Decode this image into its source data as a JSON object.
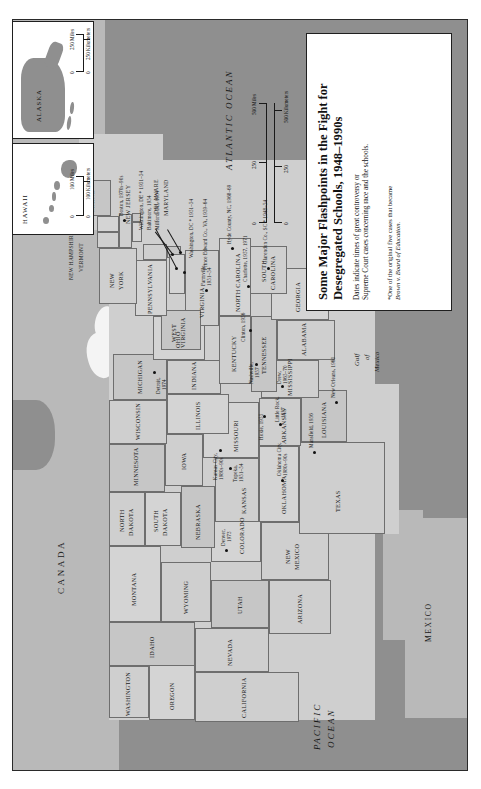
{
  "document": {
    "kind": "historical-thematic-map",
    "orientation": "landscape-printed-sideways"
  },
  "title_card": {
    "title_line_1": "Some Major Flashpoints in the Fight for",
    "title_line_2": "Desegregated Schools, 1948–1990s",
    "subtitle_line_1": "Dates indicate times of great controversy or",
    "subtitle_line_2": "Supreme Court cases concerning race and the schools.",
    "footnote_line_1": "*One of the original five cases that became",
    "footnote_line_2": "Brown v. Board of Education."
  },
  "main_scale": {
    "miles_label": "500 Miles",
    "miles_ticks": [
      "0",
      "250",
      "500"
    ],
    "km_label": "500 Kilometers",
    "km_ticks": [
      "0",
      "250",
      "500"
    ]
  },
  "oceans": {
    "atlantic": "ATLANTIC OCEAN",
    "pacific_line_1": "PACIFIC",
    "pacific_line_2": "OCEAN",
    "gulf_line_1": "Gulf",
    "gulf_line_2": "of",
    "gulf_line_3": "Mexico"
  },
  "countries": {
    "canada": "CANADA",
    "mexico": "MEXICO"
  },
  "states": [
    {
      "name": "WASHINGTON"
    },
    {
      "name": "OREGON"
    },
    {
      "name": "IDAHO"
    },
    {
      "name": "MONTANA"
    },
    {
      "name": "WYOMING"
    },
    {
      "name": "NEVADA"
    },
    {
      "name": "UTAH"
    },
    {
      "name": "CALIFORNIA"
    },
    {
      "name": "ARIZONA"
    },
    {
      "name": "NEW\nMEXICO"
    },
    {
      "name": "COLORADO"
    },
    {
      "name": "NORTH\nDAKOTA"
    },
    {
      "name": "SOUTH\nDAKOTA"
    },
    {
      "name": "NEBRASKA"
    },
    {
      "name": "KANSAS"
    },
    {
      "name": "OKLAHOMA"
    },
    {
      "name": "TEXAS"
    },
    {
      "name": "MINNESOTA"
    },
    {
      "name": "IOWA"
    },
    {
      "name": "MISSOURI"
    },
    {
      "name": "ARKANSAS"
    },
    {
      "name": "LOUISIANA"
    },
    {
      "name": "WISCONSIN"
    },
    {
      "name": "ILLINOIS"
    },
    {
      "name": "MISSISSIPPI"
    },
    {
      "name": "MICHIGAN"
    },
    {
      "name": "INDIANA"
    },
    {
      "name": "OHIO"
    },
    {
      "name": "KENTUCKY"
    },
    {
      "name": "TENNESSEE"
    },
    {
      "name": "ALABAMA"
    },
    {
      "name": "GEORGIA"
    },
    {
      "name": "FLORIDA"
    },
    {
      "name": "SOUTH\nCAROLINA"
    },
    {
      "name": "NORTH CAROLINA"
    },
    {
      "name": "VIRGINIA"
    },
    {
      "name": "WEST\nVIRGINIA"
    },
    {
      "name": "PENNSYLVANIA"
    },
    {
      "name": "NEW\nYORK"
    },
    {
      "name": "MAINE"
    },
    {
      "name": "VERMONT"
    },
    {
      "name": "NEW HAMPSHIRE"
    },
    {
      "name": "MASSACHUSETTS"
    },
    {
      "name": "RHODE ISLAND"
    },
    {
      "name": "CONNECTICUT"
    },
    {
      "name": "NEW JERSEY"
    },
    {
      "name": "DELAWARE"
    },
    {
      "name": "MARYLAND"
    }
  ],
  "state_labels": {
    "washington": "WASHINGTON",
    "oregon": "OREGON",
    "idaho": "IDAHO",
    "montana": "MONTANA",
    "wyoming": "WYOMING",
    "nevada": "NEVADA",
    "utah": "UTAH",
    "california": "CALIFORNIA",
    "arizona": "ARIZONA",
    "new_mexico_1": "NEW",
    "new_mexico_2": "MEXICO",
    "colorado": "COLORADO",
    "north_dakota_1": "NORTH",
    "north_dakota_2": "DAKOTA",
    "south_dakota_1": "SOUTH",
    "south_dakota_2": "DAKOTA",
    "nebraska": "NEBRASKA",
    "kansas": "KANSAS",
    "oklahoma": "OKLAHOMA",
    "texas": "TEXAS",
    "minnesota": "MINNESOTA",
    "iowa": "IOWA",
    "missouri": "MISSOURI",
    "arkansas": "ARKANSAS",
    "louisiana": "LOUISIANA",
    "wisconsin": "WISCONSIN",
    "illinois": "ILLINOIS",
    "mississippi": "MISSISSIPPI",
    "michigan": "MICHIGAN",
    "indiana": "INDIANA",
    "ohio": "OHIO",
    "kentucky": "KENTUCKY",
    "tennessee": "TENNESSEE",
    "alabama": "ALABAMA",
    "georgia": "GEORGIA",
    "florida": "FLORIDA",
    "south_carolina_1": "SOUTH",
    "south_carolina_2": "CAROLINA",
    "north_carolina": "NORTH CAROLINA",
    "virginia": "VIRGINIA",
    "west_virginia_1": "WEST",
    "west_virginia_2": "VIRGINIA",
    "pennsylvania": "PENNSYLVANIA",
    "new_york_1": "NEW",
    "new_york_2": "YORK",
    "maine": "MAINE",
    "vermont": "VERMONT",
    "new_hampshire": "NEW HAMPSHIRE",
    "massachusetts": "MASSACHUSETTS",
    "rhode_island": "RHODE ISLAND",
    "connecticut": "CONNECTICUT",
    "new_jersey_1": "NEW JERSEY",
    "delaware": "DELAWARE",
    "maryland": "MARYLAND"
  },
  "flashpoints": [
    {
      "id": "boston",
      "label": "Boston, 1970s–90s"
    },
    {
      "id": "wilmington",
      "label": "Wilmington, DE * 1951–54"
    },
    {
      "id": "baltimore",
      "label": "Baltimore, 1954"
    },
    {
      "id": "milford",
      "label": "Milford, DE, 1954"
    },
    {
      "id": "washington_dc",
      "label": "Washington, DC * 1951–54"
    },
    {
      "id": "farmville",
      "label": "Farmville,"
    },
    {
      "id": "farmville_date",
      "label": "1951–54"
    },
    {
      "id": "prince_edward",
      "label": "Prince Edward Co., VA, 1959–64"
    },
    {
      "id": "hyde_county",
      "label": "Hyde County, NC, 1968–69"
    },
    {
      "id": "clarendon",
      "label": "Clarendon Co., SC * 1948–54"
    },
    {
      "id": "charlotte",
      "label": "Charlotte, 1957, 1971"
    },
    {
      "id": "detroit",
      "label": "Detroit,"
    },
    {
      "id": "detroit_date",
      "label": "1974"
    },
    {
      "id": "nashville",
      "label": "Nashville,"
    },
    {
      "id": "nashville_date",
      "label": "1957"
    },
    {
      "id": "clinton",
      "label": "Clinton, 1956"
    },
    {
      "id": "hoxie",
      "label": "Hoxie, 1955"
    },
    {
      "id": "drew",
      "label": "Drew,"
    },
    {
      "id": "drew_date",
      "label": "1965–70"
    },
    {
      "id": "little_rock",
      "label": "Little Rock,"
    },
    {
      "id": "little_rock_d",
      "label": "1957"
    },
    {
      "id": "kansas_city",
      "label": "Kansas City,"
    },
    {
      "id": "kansas_city_d",
      "label": "1980s–90s"
    },
    {
      "id": "topeka",
      "label": "Topeka,"
    },
    {
      "id": "topeka_date",
      "label": "1951–54"
    },
    {
      "id": "oklahoma_city",
      "label": "Oklahoma City,"
    },
    {
      "id": "okc_date",
      "label": "1980s–90s"
    },
    {
      "id": "mansfield",
      "label": "Mansfield, 1956"
    },
    {
      "id": "new_orleans",
      "label": "New Orleans, 1960"
    },
    {
      "id": "denver",
      "label": "Denver,"
    },
    {
      "id": "denver_date",
      "label": "1973"
    }
  ],
  "insets": {
    "hawaii": {
      "name": "HAWAII",
      "miles_label": "100 Miles",
      "miles_zero": "0",
      "km_label": "100 Kilometers",
      "km_zero": "0"
    },
    "alaska": {
      "name": "ALASKA",
      "miles_label": "250 Miles",
      "miles_zero": "0",
      "km_label": "250 Kilometers",
      "km_zero": "0"
    }
  }
}
